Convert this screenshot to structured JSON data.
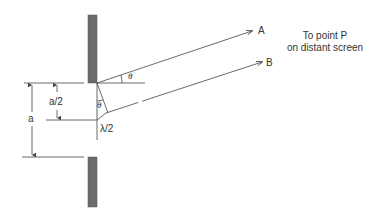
{
  "diagram": {
    "type": "single-slit-diffraction",
    "rays": [
      {
        "label": "A"
      },
      {
        "label": "B"
      }
    ],
    "caption": {
      "line1": "To point P",
      "line2": "on distant screen"
    },
    "dimensions": {
      "full_width_label": "a",
      "half_width_label": "a/2",
      "path_difference_label": "λ/2"
    },
    "angle_label": "θ",
    "colors": {
      "barrier": "#6b6b6b",
      "line": "#444444",
      "text": "#333333"
    }
  }
}
